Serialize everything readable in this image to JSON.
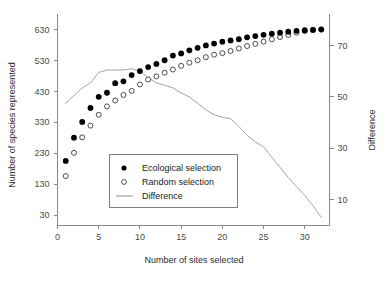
{
  "chart_data": {
    "type": "scatter",
    "title": "",
    "xlabel": "Number of sites selected",
    "ylabel": "Number of species represented",
    "y2label": "Difference",
    "grid": false,
    "legend_position": "center-left",
    "xlim": [
      0,
      33
    ],
    "ylim": [
      -2,
      660
    ],
    "y2lim": [
      0,
      80
    ],
    "xticks": [
      0,
      5,
      10,
      15,
      20,
      25,
      30
    ],
    "yticks": [
      30,
      130,
      230,
      330,
      430,
      530,
      630
    ],
    "y2ticks": [
      10,
      30,
      50,
      70
    ],
    "x": [
      1,
      2,
      3,
      4,
      5,
      6,
      7,
      8,
      9,
      10,
      11,
      12,
      13,
      14,
      15,
      16,
      17,
      18,
      19,
      20,
      21,
      22,
      23,
      24,
      25,
      26,
      27,
      28,
      29,
      30,
      31,
      32
    ],
    "series": [
      {
        "name": "Ecological selection",
        "marker": "filled-circle",
        "color": "#000000",
        "axis": "left",
        "values": [
          205,
          280,
          331,
          376,
          412,
          425,
          456,
          462,
          482,
          495,
          508,
          518,
          530,
          545,
          552,
          562,
          570,
          578,
          584,
          590,
          594,
          598,
          604,
          608,
          612,
          616,
          619,
          622,
          625,
          627,
          628,
          629
        ]
      },
      {
        "name": "Random selection",
        "marker": "open-circle",
        "color": "#ffffff",
        "axis": "left",
        "values": [
          156,
          231,
          281,
          319,
          354,
          381,
          400,
          418,
          431,
          452,
          468,
          478,
          490,
          500,
          512,
          522,
          530,
          540,
          548,
          553,
          560,
          568,
          576,
          583,
          590,
          598,
          605,
          612,
          619,
          624,
          628,
          630
        ]
      },
      {
        "name": "Difference",
        "marker": "line",
        "color": "#9a9a9a",
        "axis": "right",
        "values": [
          47.5,
          50.5,
          53.5,
          55.5,
          59.5,
          60.5,
          60.5,
          60.5,
          61.0,
          60.0,
          57.5,
          55.5,
          54.5,
          53.5,
          51.5,
          50.0,
          47.5,
          45.0,
          43.0,
          42.0,
          41.5,
          38.5,
          35.0,
          32.5,
          30.5,
          26.5,
          22.5,
          18.5,
          15.0,
          11.5,
          7.5,
          3.0
        ]
      }
    ],
    "legend_entries": [
      {
        "label": "Ecological selection",
        "marker": "filled-circle"
      },
      {
        "label": "Random selection",
        "marker": "open-circle"
      },
      {
        "label": "Difference",
        "marker": "line"
      }
    ]
  }
}
